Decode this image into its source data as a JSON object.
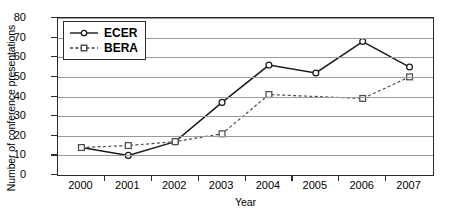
{
  "chart_data": {
    "type": "line",
    "title": "",
    "xlabel": "Year",
    "ylabel": "Number of conference presentations",
    "categories": [
      "2000",
      "2001",
      "2002",
      "2003",
      "2004",
      "2005",
      "2006",
      "2007"
    ],
    "x": [
      2000,
      2001,
      2002,
      2003,
      2004,
      2005,
      2006,
      2007
    ],
    "xlim": [
      2000,
      2007
    ],
    "ylim": [
      0,
      80
    ],
    "yticks": [
      0,
      10,
      20,
      30,
      40,
      50,
      60,
      70,
      80
    ],
    "grid": "horizontal",
    "legend_position": "top-left-inside",
    "series": [
      {
        "name": "ECER",
        "line_style": "solid",
        "marker": "open-circle",
        "color": "#1a1a1a",
        "values": [
          14,
          10,
          17,
          37,
          56,
          52,
          68,
          55
        ]
      },
      {
        "name": "BERA",
        "line_style": "dashed",
        "marker": "open-square",
        "color": "#4d4d4d",
        "values": [
          14,
          15,
          17,
          21,
          41,
          null,
          39,
          50
        ]
      }
    ]
  },
  "legend": {
    "items": [
      {
        "label": "ECER"
      },
      {
        "label": "BERA"
      }
    ]
  },
  "axes": {
    "y_title": "Number of conference presentations",
    "x_title": "Year",
    "y_tick_labels": [
      "0",
      "10",
      "20",
      "30",
      "40",
      "50",
      "60",
      "70",
      "80"
    ],
    "x_tick_labels": [
      "2000",
      "2001",
      "2002",
      "2003",
      "2004",
      "2005",
      "2006",
      "2007"
    ]
  }
}
